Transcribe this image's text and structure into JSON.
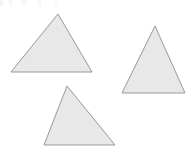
{
  "canvas": {
    "width": 192,
    "height": 153,
    "background_color": "#ffffff"
  },
  "style": {
    "fill_color": "#e8e8e8",
    "stroke_color": "#999999",
    "stroke_width": 1
  },
  "figure": {
    "title": "",
    "shape_count": 3,
    "shape_type": "triangle"
  },
  "shapes": [
    {
      "name": "triangle-upper-left",
      "type": "triangle",
      "points": "58,14 92,72 11,72",
      "vertices": [
        [
          58,
          14
        ],
        [
          92,
          72
        ],
        [
          11,
          72
        ]
      ],
      "fill": "#e8e8e8",
      "stroke": "#999999",
      "stroke_width": 1
    },
    {
      "name": "triangle-right",
      "type": "triangle",
      "points": "155,26 185,93 122,93",
      "vertices": [
        [
          155,
          26
        ],
        [
          185,
          93
        ],
        [
          122,
          93
        ]
      ],
      "fill": "#e8e8e8",
      "stroke": "#999999",
      "stroke_width": 1
    },
    {
      "name": "triangle-lower-center",
      "type": "triangle",
      "points": "67,86 115,145 44,145",
      "vertices": [
        [
          67,
          86
        ],
        [
          115,
          145
        ],
        [
          44,
          145
        ]
      ],
      "fill": "#e8e8e8",
      "stroke": "#999999",
      "stroke_width": 1
    }
  ]
}
